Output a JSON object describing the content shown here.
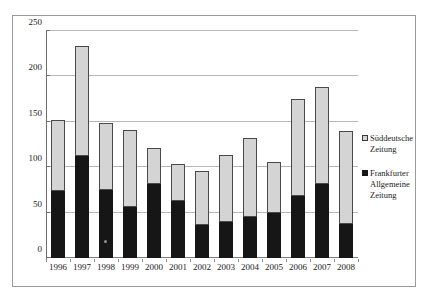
{
  "chart_data": {
    "type": "bar",
    "subtype": "stacked-vertical",
    "title": "",
    "subtitle": "",
    "xlabel": "",
    "ylabel": "",
    "categories": [
      "1996",
      "1997",
      "1998",
      "1999",
      "2000",
      "2001",
      "2002",
      "2003",
      "2004",
      "2005",
      "2006",
      "2007",
      "2008"
    ],
    "series": [
      {
        "name": "Frankfurter Allgemeine Zeitung",
        "color": "#161616",
        "stack_position": "bottom",
        "values": [
          74,
          112,
          75,
          56,
          81,
          63,
          36,
          40,
          45,
          50,
          68,
          81,
          38
        ]
      },
      {
        "name": "Süddeutsche Zeitung",
        "color": "#d4d4d4",
        "stack_position": "top",
        "values": [
          78,
          122,
          74,
          85,
          40,
          41,
          60,
          74,
          87,
          56,
          107,
          107,
          102
        ]
      }
    ],
    "totals": [
      152,
      234,
      149,
      141,
      121,
      104,
      96,
      114,
      132,
      106,
      175,
      188,
      140
    ],
    "ylim": [
      0,
      250
    ],
    "yticks": [
      0,
      50,
      100,
      150,
      200,
      250
    ],
    "ytick_labels": [
      "0",
      "50",
      "100",
      "150",
      "200",
      "250"
    ],
    "grid": true,
    "grid_axis": "y",
    "legend_position": "right"
  },
  "legend": {
    "entries": [
      {
        "label": "Süddeutsche Zeitung",
        "swatch": "light-gray-swatch-icon"
      },
      {
        "label": "Frankfurter Allgemeine Zeitung",
        "swatch": "black-swatch-icon"
      }
    ]
  }
}
